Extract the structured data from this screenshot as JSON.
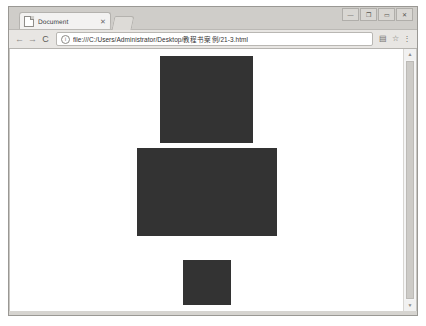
{
  "window": {
    "controls": [
      {
        "name": "minimize",
        "glyph": "—"
      },
      {
        "name": "restore",
        "glyph": "❐"
      },
      {
        "name": "maximize",
        "glyph": "▭"
      },
      {
        "name": "close",
        "glyph": "✕"
      }
    ]
  },
  "tabs": [
    {
      "title": "Document",
      "close_glyph": "✕"
    }
  ],
  "toolbar": {
    "back_glyph": "←",
    "forward_glyph": "→",
    "reload_glyph": "C",
    "site_info_glyph": "i",
    "url": "file:///C:/Users/Administrator/Desktop/教程书案例/21-3.html",
    "extension_glyph": "▤",
    "bookmark_glyph": "☆",
    "menu_glyph": "⋮"
  },
  "scrollbar": {
    "up_glyph": "▲",
    "down_glyph": "▼"
  },
  "page": {
    "background": "#ffffff",
    "block_color": "#333333",
    "blocks": [
      {
        "name": "block-1",
        "width": 93,
        "height": 87,
        "margin_top": 7
      },
      {
        "name": "block-2",
        "width": 140,
        "height": 88,
        "margin_top": 5
      },
      {
        "name": "block-3",
        "width": 48,
        "height": 45,
        "margin_top": 24
      }
    ]
  }
}
